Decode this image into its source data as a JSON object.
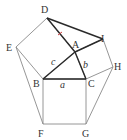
{
  "diagram": {
    "points": {
      "D": {
        "label": "D",
        "x": 47,
        "y": 18
      },
      "I": {
        "label": "I",
        "x": 103,
        "y": 39
      },
      "A": {
        "label": "A",
        "x": 75,
        "y": 52
      },
      "E": {
        "label": "E",
        "x": 16,
        "y": 47
      },
      "H": {
        "label": "H",
        "x": 113,
        "y": 67
      },
      "B": {
        "label": "B",
        "x": 43,
        "y": 79
      },
      "C": {
        "label": "C",
        "x": 86,
        "y": 79
      },
      "F": {
        "label": "F",
        "x": 43,
        "y": 124
      },
      "G": {
        "label": "G",
        "x": 86,
        "y": 124
      }
    },
    "sides": {
      "a": "a",
      "b": "b",
      "c": "c"
    },
    "accent_color": "#d04040"
  }
}
